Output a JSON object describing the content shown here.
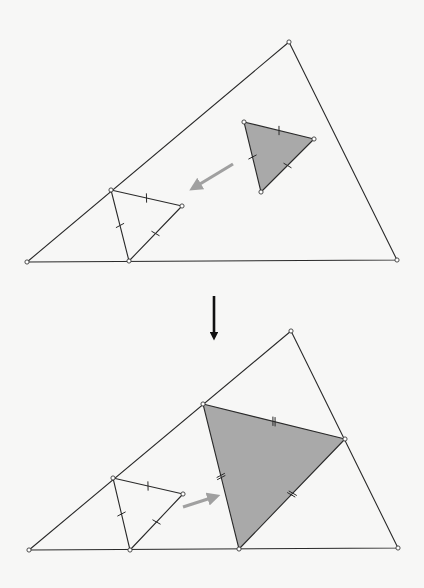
{
  "colors": {
    "background": "#f7f7f6",
    "line": "#2a2a2a",
    "shade": "#a9a9a9",
    "move_arrow": "#a0a0a0",
    "step_arrow": "#111111"
  },
  "panels": [
    {
      "id": "before",
      "big_triangle": [
        [
          27,
          262
        ],
        [
          289,
          42
        ],
        [
          397,
          260
        ]
      ],
      "small_triangle": {
        "points": [
          [
            111,
            190
          ],
          [
            182,
            206
          ],
          [
            129,
            261
          ]
        ],
        "tick_count": 1
      },
      "shaded_triangle": {
        "points": [
          [
            244,
            122
          ],
          [
            314,
            139
          ],
          [
            261,
            192
          ]
        ],
        "tick_count": 1
      },
      "move_arrow": {
        "from": [
          233,
          164
        ],
        "to": [
          195,
          187
        ],
        "icon": "arrow-left-down"
      }
    },
    {
      "id": "after",
      "big_triangle": [
        [
          29,
          550
        ],
        [
          291,
          331
        ],
        [
          398,
          548
        ]
      ],
      "small_triangle": {
        "points": [
          [
            113,
            478
          ],
          [
            183,
            494
          ],
          [
            130,
            550
          ]
        ],
        "tick_count": 1
      },
      "shaded_triangle": {
        "points": [
          [
            203,
            404
          ],
          [
            345,
            439
          ],
          [
            239,
            549
          ]
        ],
        "tick_count": 2
      },
      "move_arrow": {
        "from": [
          183,
          507
        ],
        "to": [
          214,
          497
        ],
        "icon": "arrow-right-up"
      }
    }
  ],
  "step_arrow": {
    "from": [
      214,
      296
    ],
    "to": [
      214,
      343
    ],
    "icon": "arrow-down"
  }
}
